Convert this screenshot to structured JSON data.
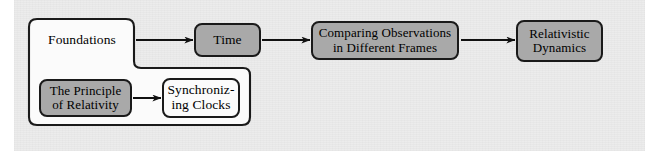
{
  "diagram": {
    "type": "flowchart",
    "background_color": "#ececec",
    "page_margin_color": "#ffffff",
    "colors": {
      "gray_fill": "#a9a9a9",
      "white_fill": "#fbfbfb",
      "outline": "#1a1a1a",
      "arrow": "#111111",
      "text": "#000000"
    },
    "group": {
      "name": "foundations-group",
      "label": "Foundations",
      "fill": "white",
      "shape": "stepped-rounded-rectangle"
    },
    "nodes": [
      {
        "id": "foundations",
        "label": "Foundations",
        "fill": "white",
        "role": "container-heading"
      },
      {
        "id": "principle-of-relativity",
        "label": "The Principle\nof Relativity",
        "fill": "gray",
        "role": "sub-node"
      },
      {
        "id": "synchronizing-clocks",
        "label": "Synchroniz-\ning Clocks",
        "fill": "white",
        "role": "sub-node"
      },
      {
        "id": "time",
        "label": "Time",
        "fill": "gray",
        "role": "node"
      },
      {
        "id": "comparing-observations",
        "label": "Comparing Observations\nin Different Frames",
        "fill": "gray",
        "role": "node"
      },
      {
        "id": "relativistic-dynamics",
        "label": "Relativistic\nDynamics",
        "fill": "gray",
        "role": "node"
      }
    ],
    "edges": [
      {
        "id": "edge-principle-to-sync",
        "from": "principle-of-relativity",
        "to": "synchronizing-clocks",
        "style": "solid-arrow"
      },
      {
        "id": "edge-foundations-to-time",
        "from": "foundations",
        "to": "time",
        "style": "solid-arrow"
      },
      {
        "id": "edge-time-to-comparing",
        "from": "time",
        "to": "comparing-observations",
        "style": "solid-arrow"
      },
      {
        "id": "edge-comparing-to-dynamics",
        "from": "comparing-observations",
        "to": "relativistic-dynamics",
        "style": "solid-arrow"
      }
    ]
  }
}
